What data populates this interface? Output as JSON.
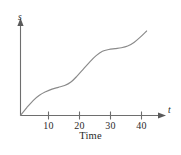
{
  "chart_data": {
    "type": "line",
    "title": "",
    "subtitle": "",
    "xlabel": "Time",
    "ylabel": "",
    "x_axis_symbol": "t",
    "y_axis_symbol": "s",
    "xlim": [
      0,
      46
    ],
    "ylim": [
      0,
      100
    ],
    "grid": false,
    "legend": false,
    "xticks": [
      10,
      20,
      30,
      40
    ],
    "xtick_labels": [
      "10",
      "20",
      "30",
      "40"
    ],
    "yticks": [],
    "ytick_labels": [],
    "annotations": [],
    "series": [
      {
        "name": "distance",
        "color": "#8a8a8a",
        "x": [
          0,
          2,
          4,
          6,
          8,
          10,
          12,
          14,
          16,
          18,
          20,
          22,
          24,
          26,
          28,
          30,
          32,
          34,
          36,
          38,
          40
        ],
        "y": [
          0,
          9,
          17,
          23,
          27,
          30,
          32,
          34,
          38,
          45,
          53,
          61,
          68,
          73,
          75,
          76,
          77,
          79,
          83,
          89,
          96
        ]
      }
    ]
  },
  "axes": {
    "y_label": "s",
    "x_label": "t",
    "x_title": "Time",
    "tick_labels": [
      "10",
      "20",
      "30",
      "40"
    ]
  },
  "colors": {
    "curve": "#8a8a8a",
    "axis": "#6e6e6e",
    "text": "#2b2b2b",
    "background": "#ffffff"
  }
}
